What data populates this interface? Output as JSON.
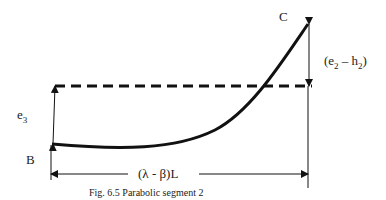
{
  "figure": {
    "caption": "Fig. 6.5 Parabolic segment 2",
    "labels": {
      "point_b": "B",
      "point_c": "C",
      "e3": "e",
      "e3_sub": "3",
      "e2_h2_open": "(e",
      "e2_sub": "2",
      "e2_h2_mid": " – h",
      "h2_sub": "2",
      "e2_h2_close": ")",
      "span": "(λ - β)L"
    },
    "colors": {
      "line": "#111111",
      "text": "#222222"
    }
  }
}
